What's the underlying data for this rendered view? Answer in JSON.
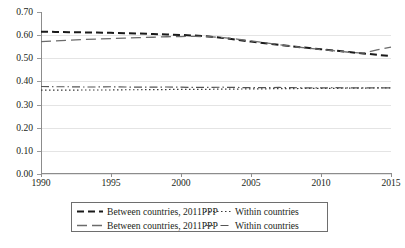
{
  "chart_data": {
    "type": "line",
    "title": "",
    "subtitle": "",
    "xlabel": "",
    "ylabel": "",
    "xlim": [
      1990,
      2015
    ],
    "ylim": [
      0.0,
      0.7
    ],
    "grid": true,
    "legend_position": "bottom",
    "x_ticks": [
      "1990",
      "1995",
      "2000",
      "2005",
      "2010",
      "2015"
    ],
    "x_tick_values": [
      1990,
      1995,
      2000,
      2005,
      2010,
      2015
    ],
    "y_ticks": [
      "0.00",
      "0.10",
      "0.20",
      "0.30",
      "0.40",
      "0.50",
      "0.60",
      "0.70"
    ],
    "y_tick_values": [
      0.0,
      0.1,
      0.2,
      0.3,
      0.4,
      0.5,
      0.6,
      0.7
    ],
    "x": [
      1990,
      1991,
      1992,
      1993,
      1994,
      1995,
      1996,
      1997,
      1998,
      1999,
      2000,
      2001,
      2002,
      2003,
      2004,
      2005,
      2006,
      2007,
      2008,
      2009,
      2010,
      2011,
      2012,
      2013,
      2014,
      2015
    ],
    "series": [
      {
        "name": "Between countries, 2011PPP",
        "style": "heavy-dashed",
        "color": "#1a1a1a",
        "width": 2.0,
        "dash": "7,4",
        "values": [
          0.615,
          0.614,
          0.613,
          0.612,
          0.611,
          0.61,
          0.608,
          0.607,
          0.605,
          0.603,
          0.601,
          0.598,
          0.594,
          0.588,
          0.58,
          0.572,
          0.565,
          0.558,
          0.551,
          0.545,
          0.539,
          0.533,
          0.527,
          0.521,
          0.515,
          0.51
        ]
      },
      {
        "name": "Between countries, 2011PPP",
        "style": "long-dashed",
        "color": "#6b6b6b",
        "width": 1.3,
        "dash": "10,5",
        "values": [
          0.572,
          0.575,
          0.578,
          0.581,
          0.583,
          0.585,
          0.587,
          0.589,
          0.591,
          0.593,
          0.594,
          0.595,
          0.593,
          0.589,
          0.583,
          0.575,
          0.567,
          0.559,
          0.551,
          0.544,
          0.538,
          0.532,
          0.526,
          0.522,
          0.536,
          0.548
        ]
      },
      {
        "name": "Within countries",
        "style": "dotted",
        "color": "#3a3a3a",
        "width": 1.2,
        "dash": "1.5,2.5",
        "values": [
          0.362,
          0.362,
          0.362,
          0.363,
          0.363,
          0.363,
          0.364,
          0.364,
          0.365,
          0.365,
          0.366,
          0.366,
          0.366,
          0.367,
          0.367,
          0.368,
          0.368,
          0.369,
          0.369,
          0.37,
          0.37,
          0.37,
          0.371,
          0.371,
          0.372,
          0.372
        ]
      },
      {
        "name": "Within countries",
        "style": "dash-dot",
        "color": "#555555",
        "width": 1.2,
        "dash": "8,3,1.5,3",
        "values": [
          0.378,
          0.377,
          0.377,
          0.376,
          0.376,
          0.377,
          0.376,
          0.375,
          0.375,
          0.376,
          0.375,
          0.374,
          0.374,
          0.375,
          0.374,
          0.373,
          0.373,
          0.374,
          0.373,
          0.372,
          0.372,
          0.373,
          0.372,
          0.372,
          0.372,
          0.372
        ]
      }
    ],
    "legend": [
      {
        "label": "Between countries, 2011PPP",
        "style": "heavy-dashed"
      },
      {
        "label": "Within countries",
        "style": "dotted"
      },
      {
        "label": "Between countries, 2011PPP",
        "style": "long-dashed"
      },
      {
        "label": "Within countries",
        "style": "dash-dot"
      }
    ]
  },
  "colors": {
    "axis": "#8c8c8c",
    "grid": "#e4e4e4",
    "text": "#231f20",
    "legend_border": "#6e6e6e",
    "background": "#ffffff"
  }
}
